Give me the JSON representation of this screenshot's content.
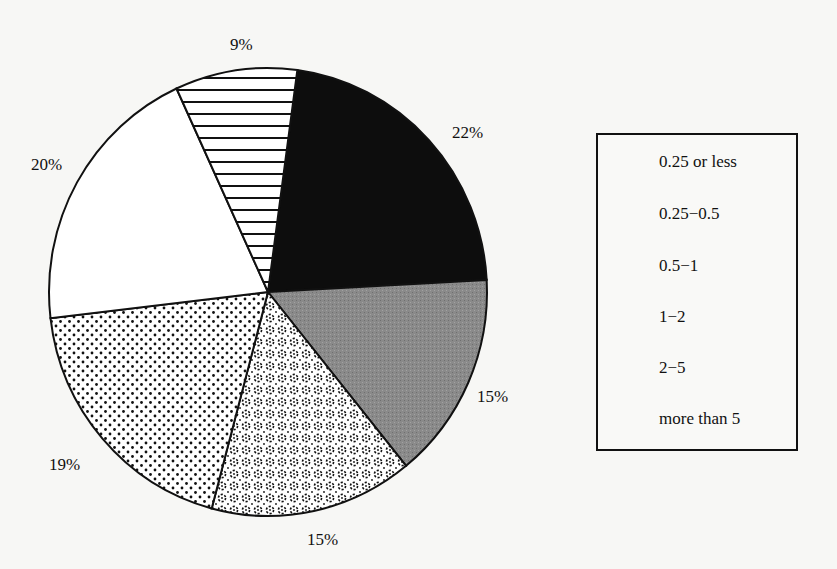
{
  "chart_data": {
    "type": "pie",
    "title": "",
    "start_angle_deg": -82.3,
    "direction": "clockwise",
    "slices": [
      {
        "label": "0.25 or less",
        "value": 22,
        "display": "22%",
        "pattern": "solid-black",
        "color": "#0d0d0d"
      },
      {
        "label": "0.25-0.5",
        "value": 15,
        "display": "15%",
        "pattern": "solid-gray",
        "color": "#888888"
      },
      {
        "label": "0.5-1",
        "value": 15,
        "display": "15%",
        "pattern": "swirl-dots",
        "color": "#ffffff"
      },
      {
        "label": "1-2",
        "value": 19,
        "display": "19%",
        "pattern": "fine-dots",
        "color": "#ffffff"
      },
      {
        "label": "2-5",
        "value": 20,
        "display": "20%",
        "pattern": "none",
        "color": "#ffffff"
      },
      {
        "label": "more than 5",
        "value": 9,
        "display": "9%",
        "pattern": "horizontal-lines",
        "color": "#ffffff"
      }
    ],
    "legend": {
      "position": "right",
      "entries": [
        "0.25 or less",
        "0.25-0.5",
        "0.5-1",
        "1-2",
        "2-5",
        "more than 5"
      ]
    }
  },
  "labels": {
    "l0": "22%",
    "l1": "15%",
    "l2": "15%",
    "l3": "19%",
    "l4": "20%",
    "l5": "9%"
  },
  "legend_labels": [
    "0.25 or less",
    "0.25−0.5",
    "0.5−1",
    "1−2",
    "2−5",
    "more than 5"
  ]
}
